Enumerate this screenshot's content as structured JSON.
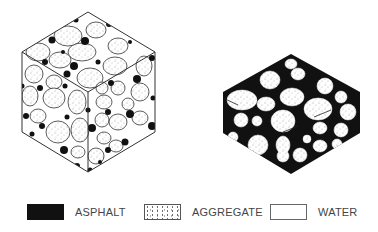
{
  "figure": {
    "left_panel": {
      "name": "asphalt-aggregate-water-cube"
    },
    "right_panel": {
      "name": "asphalt-aggregate-hexagon"
    }
  },
  "legend": {
    "items": [
      {
        "key": "asphalt",
        "label": "ASPHALT",
        "color": "#111111"
      },
      {
        "key": "aggregate",
        "label": "AGGREGATE",
        "color": "#ffffff"
      },
      {
        "key": "water",
        "label": "WATER",
        "color": "#ffffff"
      }
    ]
  }
}
